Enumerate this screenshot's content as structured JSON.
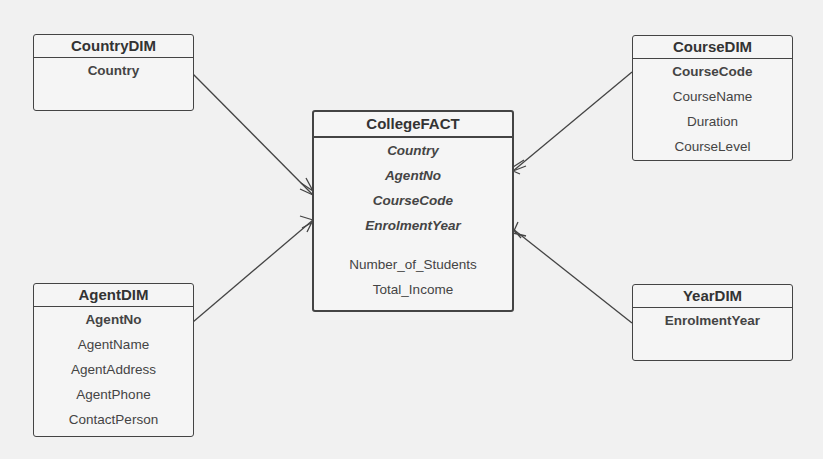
{
  "entities": {
    "country": {
      "title": "CountryDIM",
      "pk": "Country",
      "attrs": []
    },
    "course": {
      "title": "CourseDIM",
      "pk": "CourseCode",
      "attrs": [
        "CourseName",
        "Duration",
        "CourseLevel"
      ]
    },
    "fact": {
      "title": "CollegeFACT",
      "fks": [
        "Country",
        "AgentNo",
        "CourseCode",
        "EnrolmentYear"
      ],
      "measures": [
        "Number_of_Students",
        "Total_Income"
      ]
    },
    "agent": {
      "title": "AgentDIM",
      "pk": "AgentNo",
      "attrs": [
        "AgentName",
        "AgentAddress",
        "AgentPhone",
        "ContactPerson"
      ]
    },
    "year": {
      "title": "YearDIM",
      "pk": "EnrolmentYear",
      "attrs": []
    }
  },
  "relationships": [
    {
      "from": "CountryDIM",
      "to": "CollegeFACT",
      "cardinality": "one-to-many"
    },
    {
      "from": "CourseDIM",
      "to": "CollegeFACT",
      "cardinality": "one-to-many"
    },
    {
      "from": "AgentDIM",
      "to": "CollegeFACT",
      "cardinality": "one-to-many"
    },
    {
      "from": "YearDIM",
      "to": "CollegeFACT",
      "cardinality": "one-to-many"
    }
  ]
}
